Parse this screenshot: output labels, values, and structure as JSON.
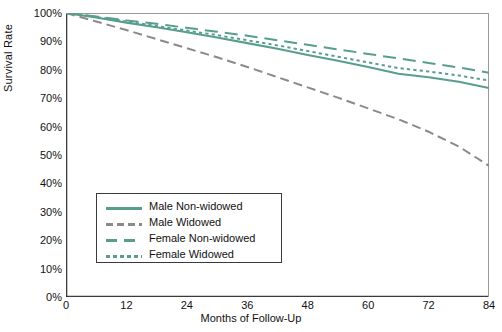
{
  "chart_data": {
    "type": "line",
    "title": "",
    "xlabel": "Months of Follow-Up",
    "ylabel": "Survival Rate",
    "xlim": [
      0,
      84
    ],
    "ylim": [
      0,
      100
    ],
    "xticks": [
      "0",
      "12",
      "24",
      "36",
      "48",
      "60",
      "72",
      "84"
    ],
    "xtick_values": [
      0,
      12,
      24,
      36,
      48,
      60,
      72,
      84
    ],
    "yticks": [
      "0%",
      "10%",
      "20%",
      "30%",
      "40%",
      "50%",
      "60%",
      "70%",
      "80%",
      "90%",
      "100%"
    ],
    "ytick_values": [
      0,
      10,
      20,
      30,
      40,
      50,
      60,
      70,
      80,
      90,
      100
    ],
    "grid": false,
    "legend_position": "lower-left-inside",
    "colors": {
      "teal": "#589e8d",
      "gray": "#8a8a8a",
      "axis": "#3a3a3a",
      "background": "#ffffff"
    },
    "series": [
      {
        "name": "Male Non-widowed",
        "color": "#589e8d",
        "dash": "solid",
        "x": [
          0,
          6,
          12,
          18,
          24,
          30,
          36,
          42,
          48,
          54,
          60,
          66,
          72,
          78,
          84
        ],
        "values": [
          100,
          98.4,
          96.6,
          95.0,
          93.2,
          91.4,
          89.4,
          87.4,
          85.2,
          83.2,
          81.0,
          78.6,
          77.4,
          75.8,
          73.6
        ]
      },
      {
        "name": "Male Widowed",
        "color": "#8a8a8a",
        "dash": "dashed",
        "x": [
          0,
          6,
          12,
          18,
          24,
          30,
          36,
          42,
          48,
          54,
          60,
          66,
          72,
          78,
          84
        ],
        "values": [
          100,
          97.0,
          94.0,
          90.8,
          87.6,
          84.4,
          81.0,
          77.4,
          73.8,
          70.2,
          66.4,
          62.6,
          58.2,
          53.0,
          46.2
        ]
      },
      {
        "name": "Female Non-widowed",
        "color": "#589e8d",
        "dash": "long-dash",
        "x": [
          0,
          6,
          12,
          18,
          24,
          30,
          36,
          42,
          48,
          54,
          60,
          66,
          72,
          78,
          84
        ],
        "values": [
          100,
          98.8,
          97.4,
          96.2,
          94.8,
          93.4,
          92.0,
          90.4,
          88.8,
          87.2,
          85.6,
          84.0,
          82.4,
          80.8,
          79.0
        ]
      },
      {
        "name": "Female Widowed",
        "color": "#589e8d",
        "dash": "dotted",
        "x": [
          0,
          6,
          12,
          18,
          24,
          30,
          36,
          42,
          48,
          54,
          60,
          66,
          72,
          78,
          84
        ],
        "values": [
          100,
          98.6,
          97.0,
          95.4,
          93.8,
          92.2,
          90.4,
          88.6,
          86.6,
          84.6,
          82.6,
          80.6,
          79.4,
          78.0,
          76.2
        ]
      }
    ]
  },
  "legend": {
    "items": [
      {
        "label": "Male Non-widowed"
      },
      {
        "label": "Male Widowed"
      },
      {
        "label": "Female Non-widowed"
      },
      {
        "label": "Female Widowed"
      }
    ]
  }
}
